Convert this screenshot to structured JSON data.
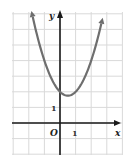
{
  "chart_data": {
    "type": "line",
    "title": "",
    "function": "y = x^2 - x + 2",
    "xlabel": "x",
    "ylabel": "y",
    "origin_label": "O",
    "tick_labels": {
      "x": [
        "1"
      ],
      "y": [
        "1"
      ]
    },
    "xlim": [
      -3,
      4
    ],
    "ylim": [
      -2,
      7
    ],
    "grid": true,
    "vertex": [
      0.5,
      1.75
    ],
    "x": [
      -1.85,
      -1.5,
      -1,
      -0.5,
      0,
      0.5,
      1,
      1.5,
      2,
      2.5,
      2.7
    ],
    "values": [
      7.27,
      5.75,
      4,
      2.75,
      2,
      1.75,
      2,
      2.75,
      4,
      5.75,
      6.59
    ],
    "colors": {
      "curve": "#6e6e6e",
      "axis": "#1a1a1a",
      "grid": "#d9d9d9"
    }
  },
  "labels": {
    "x_axis": "x",
    "y_axis": "y",
    "origin": "O",
    "x_tick": "1",
    "y_tick": "1"
  }
}
